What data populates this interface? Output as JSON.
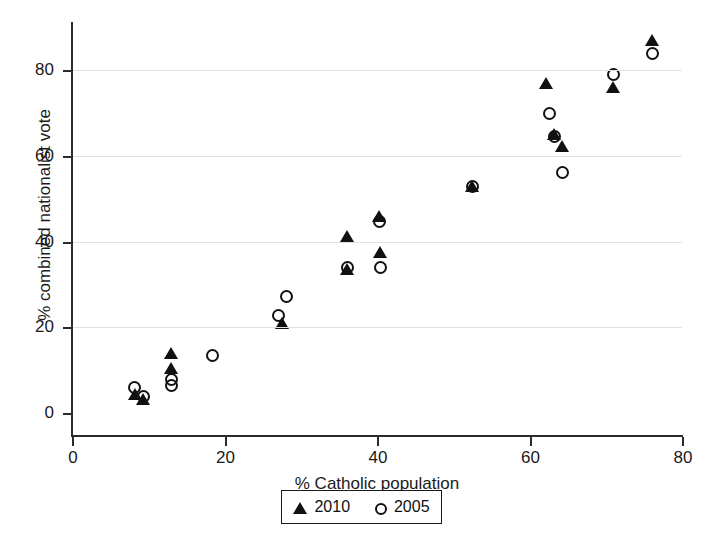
{
  "figure": {
    "title": "",
    "background_color": "#ffffff",
    "marker_color": "#111111",
    "grid_color": "#e2e2e2",
    "axis_color": "#2b2b2b"
  },
  "legend": {
    "entries": [
      {
        "label": "2010",
        "marker": "filled-triangle"
      },
      {
        "label": "2005",
        "marker": "open-circle"
      }
    ]
  },
  "axes": {
    "x": {
      "title": "% Catholic population",
      "ticks": [
        "0",
        "20",
        "40",
        "60",
        "80"
      ],
      "min": 0,
      "max": 80
    },
    "y": {
      "title": "% combined nationalist vote",
      "ticks": [
        "0",
        "20",
        "40",
        "60",
        "80"
      ],
      "min": 0,
      "max": 88
    }
  },
  "chart_data": {
    "type": "scatter",
    "title": "",
    "xlabel": "% Catholic population",
    "ylabel": "% combined nationalist vote",
    "xlim": [
      0,
      80
    ],
    "ylim": [
      0,
      88
    ],
    "grid": true,
    "legend_position": "bottom-center",
    "series": [
      {
        "name": "2010",
        "marker": "filled-triangle",
        "color": "#111111",
        "points": [
          [
            8.2,
            4.5
          ],
          [
            9.3,
            3.2
          ],
          [
            13.0,
            14.0
          ],
          [
            13.0,
            10.5
          ],
          [
            27.6,
            21.0
          ],
          [
            36.0,
            41.2
          ],
          [
            36.0,
            33.5
          ],
          [
            40.3,
            46.0
          ],
          [
            40.4,
            37.5
          ],
          [
            52.5,
            53.0
          ],
          [
            62.2,
            77.0
          ],
          [
            63.2,
            65.0
          ],
          [
            64.3,
            62.2
          ],
          [
            70.9,
            76.0
          ],
          [
            76.0,
            87.0
          ]
        ]
      },
      {
        "name": "2005",
        "marker": "open-circle",
        "color": "#111111",
        "points": [
          [
            8.1,
            6.0
          ],
          [
            9.3,
            4.0
          ],
          [
            13.0,
            8.0
          ],
          [
            13.0,
            6.5
          ],
          [
            18.4,
            13.6
          ],
          [
            27.0,
            22.8
          ],
          [
            28.0,
            27.2
          ],
          [
            36.0,
            34.0
          ],
          [
            40.2,
            44.8
          ],
          [
            40.4,
            34.0
          ],
          [
            52.5,
            53.0
          ],
          [
            62.6,
            70.0
          ],
          [
            63.2,
            64.5
          ],
          [
            64.3,
            56.2
          ],
          [
            70.9,
            79.0
          ],
          [
            76.0,
            84.0
          ]
        ]
      }
    ]
  }
}
